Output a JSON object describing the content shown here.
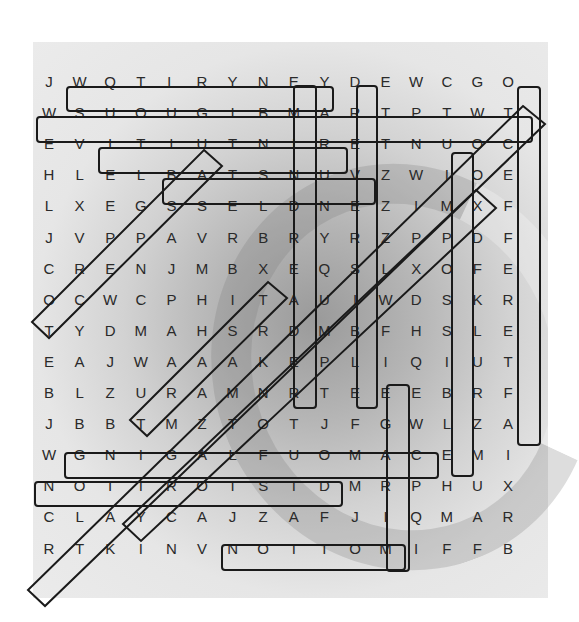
{
  "puzzle": {
    "type": "word-search",
    "rows": 16,
    "cols": 16,
    "grid": [
      "JWQTLRYNEYDEWCGO",
      "WSUOUGIBMARTPTWT",
      "EVITIUTNIRETNUOC",
      "HLELBATSNUVZWIOE",
      "LXEGSSELDNEZIMXF",
      "JVPPAVRBRYRZPPDF",
      "CRENJMBXEQSLXOFE",
      "OCWCPHITAUIWDSKR",
      "TYDMAHSRDMBFHSLE",
      "EAJWAAAKEPLIQIUT",
      "BLZURAMNRTEEEBRF",
      "JBBTMZTOTJFGWLZA",
      "WGNIGALFUOMACEMI",
      "NOITROTSIDMRPHUX",
      "CLAYCAJZAFJIQMAR",
      "RTKINVNOITOMIFFB"
    ],
    "found_words": [
      {
        "word": "AMBIGUOUS",
        "start": [
          1,
          9
        ],
        "end": [
          1,
          1
        ],
        "direction": "horizontal-reverse"
      },
      {
        "word": "COUNTERINTUITIVE",
        "start": [
          2,
          15
        ],
        "end": [
          2,
          0
        ],
        "direction": "horizontal-reverse"
      },
      {
        "word": "UNSTABLE",
        "start": [
          3,
          9
        ],
        "end": [
          3,
          2
        ],
        "direction": "horizontal-reverse"
      },
      {
        "word": "ENDLESS",
        "start": [
          4,
          10
        ],
        "end": [
          4,
          4
        ],
        "direction": "horizontal-reverse"
      },
      {
        "word": "CAMOUFLAGING",
        "start": [
          12,
          12
        ],
        "end": [
          12,
          1
        ],
        "direction": "horizontal-reverse"
      },
      {
        "word": "DISTORTION",
        "start": [
          13,
          9
        ],
        "end": [
          13,
          0
        ],
        "direction": "horizontal-reverse"
      },
      {
        "word": "MOTION",
        "start": [
          15,
          11
        ],
        "end": [
          15,
          6
        ],
        "direction": "horizontal-reverse"
      },
      {
        "word": "MINDREADER",
        "start": [
          1,
          8
        ],
        "end": [
          10,
          8
        ],
        "direction": "vertical"
      },
      {
        "word": "REVERSIBLE",
        "start": [
          1,
          10
        ],
        "end": [
          10,
          10
        ],
        "direction": "vertical"
      },
      {
        "word": "IMPOSSIBLE",
        "start": [
          3,
          13
        ],
        "end": [
          12,
          13
        ],
        "direction": "vertical"
      },
      {
        "word": "TCEFFERTFA",
        "start": [
          1,
          15
        ],
        "end": [
          11,
          15
        ],
        "direction": "vertical"
      },
      {
        "word": "EGARIM",
        "start": [
          10,
          11
        ],
        "end": [
          15,
          11
        ],
        "direction": "vertical"
      },
      {
        "word": "PERCEPTION",
        "start": [
          5,
          2
        ],
        "end": [
          8,
          0
        ],
        "direction": "diagonal"
      },
      {
        "word": "TAKE",
        "start": [
          7,
          7
        ],
        "end": [
          9,
          5
        ],
        "direction": "diagonal"
      },
      {
        "word": "ILLUSION-DIAG-1",
        "start": [
          2,
          15
        ],
        "end": [
          14,
          0
        ],
        "direction": "diagonal"
      },
      {
        "word": "ILLUSION-DIAG-2",
        "start": [
          3,
          13
        ],
        "end": [
          14,
          3
        ],
        "direction": "diagonal"
      }
    ]
  },
  "colors": {
    "panel_bg": "#e4e4e4",
    "letter": "#2a2a2a",
    "outline": "#1a1a1a"
  }
}
